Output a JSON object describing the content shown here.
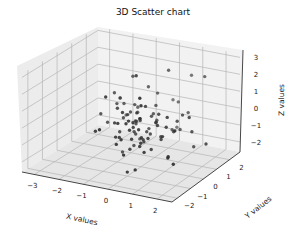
{
  "chart_data": {
    "type": "scatter",
    "projection": "3d",
    "title": "3D Scatter chart",
    "xlabel": "X values",
    "ylabel": "Y values",
    "zlabel": "Z values",
    "xticks": [
      -3,
      -2,
      -1,
      0,
      1,
      2
    ],
    "yticks": [
      -2,
      -1,
      0,
      1,
      2
    ],
    "zticks": [
      -2,
      -1,
      0,
      1,
      2,
      3
    ],
    "xlim": [
      -3.5,
      2.6
    ],
    "ylim": [
      -2.4,
      2.8
    ],
    "zlim": [
      -2.6,
      3.2
    ],
    "grid": true,
    "marker_color": "#333333",
    "pane_color": "#f0f0f0",
    "grid_color": "#b0b0b0",
    "n_points": 100,
    "note": "Approximately 100 points drawn from a standard normal distribution in x, y and z (values mostly within -2.5..2.5)."
  }
}
